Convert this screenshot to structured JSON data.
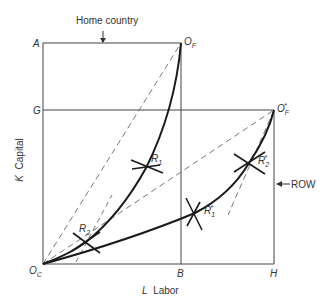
{
  "diagram": {
    "annotations": {
      "home_country": "Home country",
      "row": "ROW"
    },
    "axes": {
      "y_label_var": "K",
      "y_label": "Capital",
      "x_label_var": "L",
      "x_label": "Labor"
    },
    "points": {
      "A": "A",
      "G": "G",
      "OC": "O",
      "OC_sub": "C",
      "OF": "O",
      "OF_sub": "F",
      "OFstar": "O",
      "OFstar_sub": "F",
      "OFstar_sup": "*",
      "B": "B",
      "H": "H",
      "R1": "R",
      "R1_sub": "1",
      "R2": "R",
      "R2_sub": "2",
      "R1star": "R",
      "R1star_sub": "1",
      "R1star_sup": "*",
      "R2star": "R",
      "R2star_sub": "2",
      "R2star_sup": "*"
    },
    "colors": {
      "line": "#333333",
      "curve": "#1a1a1a",
      "background": "#ffffff"
    }
  }
}
